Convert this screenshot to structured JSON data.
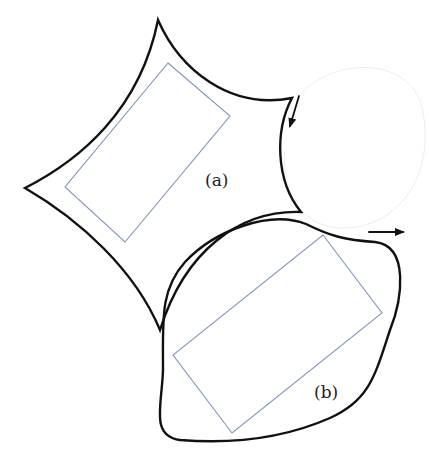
{
  "labels": {
    "a": "(a)",
    "b": "(b)"
  },
  "colors": {
    "outline": "#111111",
    "rectangle": "#7f97b8",
    "background": "#ffffff"
  },
  "shapes": {
    "a": {
      "kind": "four-pointed concave region",
      "inner": "rotated rectangle"
    },
    "b": {
      "kind": "rounded convex blob",
      "inner": "rotated rectangle"
    }
  },
  "arrows": [
    {
      "id": "arrow-a",
      "direction": "down-left"
    },
    {
      "id": "arrow-b",
      "direction": "right"
    }
  ]
}
